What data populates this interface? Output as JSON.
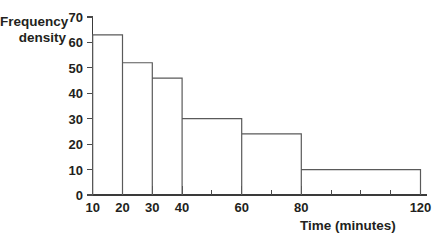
{
  "chart_data": {
    "type": "bar",
    "title": "",
    "subtitle": "",
    "xlabel": "Time (minutes)",
    "ylabel": "Frequency density",
    "ylabel_lines": [
      "Frequency",
      "density"
    ],
    "xlim": [
      10,
      120
    ],
    "ylim": [
      0,
      70
    ],
    "grid": false,
    "legend": "none",
    "x_tick_labels": [
      "10",
      "20",
      "30",
      "40",
      "60",
      "80",
      "120"
    ],
    "x_tick_values": [
      10,
      20,
      30,
      40,
      60,
      80,
      120
    ],
    "x_minor_tick_values": [
      50,
      70,
      90,
      100,
      110
    ],
    "y_tick_labels": [
      "0",
      "10",
      "20",
      "30",
      "40",
      "50",
      "60",
      "70"
    ],
    "y_tick_values": [
      0,
      10,
      20,
      30,
      40,
      50,
      60,
      70
    ],
    "bin_edges": [
      10,
      20,
      30,
      40,
      60,
      80,
      120
    ],
    "categories": [
      "10-20",
      "20-30",
      "30-40",
      "40-60",
      "60-80",
      "80-120"
    ],
    "values": [
      63,
      52,
      46,
      30,
      24,
      10
    ],
    "bars": [
      {
        "label": "10-20",
        "x0": 10,
        "x1": 20,
        "value": 63
      },
      {
        "label": "20-30",
        "x0": 20,
        "x1": 30,
        "value": 52
      },
      {
        "label": "30-40",
        "x0": 30,
        "x1": 40,
        "value": 46
      },
      {
        "label": "40-60",
        "x0": 40,
        "x1": 60,
        "value": 30
      },
      {
        "label": "60-80",
        "x0": 60,
        "x1": 80,
        "value": 24
      },
      {
        "label": "80-120",
        "x0": 80,
        "x1": 120,
        "value": 10
      }
    ]
  },
  "colors": {
    "background": "#ffffff",
    "axis": "#3a3a3a",
    "bar_outline": "#5a5a5a",
    "text": "#231f20"
  }
}
